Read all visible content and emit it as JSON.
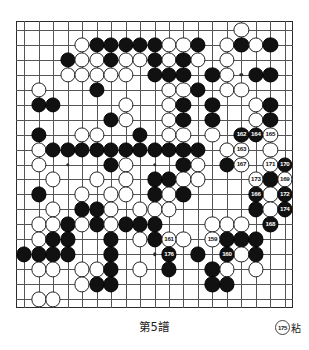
{
  "board": {
    "size": 19,
    "title": "Go game record diagram",
    "colors": {
      "black": "#111111",
      "white": "#ffffff",
      "line": "#555555",
      "border": "#2b2b2b"
    },
    "hoshi": [
      [
        3,
        3
      ],
      [
        9,
        3
      ],
      [
        15,
        3
      ],
      [
        3,
        9
      ],
      [
        9,
        9
      ],
      [
        15,
        9
      ],
      [
        3,
        15
      ],
      [
        9,
        15
      ],
      [
        15,
        15
      ]
    ],
    "stones": [
      {
        "c": "w",
        "x": 15,
        "y": 0
      },
      {
        "c": "w",
        "x": 4,
        "y": 1
      },
      {
        "c": "b",
        "x": 5,
        "y": 1
      },
      {
        "c": "b",
        "x": 6,
        "y": 1
      },
      {
        "c": "b",
        "x": 7,
        "y": 1
      },
      {
        "c": "b",
        "x": 8,
        "y": 1
      },
      {
        "c": "b",
        "x": 9,
        "y": 1
      },
      {
        "c": "w",
        "x": 10,
        "y": 1
      },
      {
        "c": "w",
        "x": 11,
        "y": 1
      },
      {
        "c": "b",
        "x": 12,
        "y": 1
      },
      {
        "c": "w",
        "x": 14,
        "y": 1
      },
      {
        "c": "b",
        "x": 15,
        "y": 1
      },
      {
        "c": "w",
        "x": 16,
        "y": 1
      },
      {
        "c": "b",
        "x": 17,
        "y": 1
      },
      {
        "c": "b",
        "x": 3,
        "y": 2
      },
      {
        "c": "w",
        "x": 4,
        "y": 2
      },
      {
        "c": "w",
        "x": 5,
        "y": 2
      },
      {
        "c": "b",
        "x": 6,
        "y": 2
      },
      {
        "c": "w",
        "x": 7,
        "y": 2
      },
      {
        "c": "w",
        "x": 8,
        "y": 2
      },
      {
        "c": "b",
        "x": 9,
        "y": 2
      },
      {
        "c": "w",
        "x": 10,
        "y": 2
      },
      {
        "c": "b",
        "x": 11,
        "y": 2
      },
      {
        "c": "w",
        "x": 12,
        "y": 2
      },
      {
        "c": "w",
        "x": 14,
        "y": 2
      },
      {
        "c": "w",
        "x": 3,
        "y": 3
      },
      {
        "c": "w",
        "x": 4,
        "y": 3
      },
      {
        "c": "w",
        "x": 5,
        "y": 3
      },
      {
        "c": "w",
        "x": 6,
        "y": 3
      },
      {
        "c": "w",
        "x": 7,
        "y": 3
      },
      {
        "c": "b",
        "x": 9,
        "y": 3
      },
      {
        "c": "b",
        "x": 10,
        "y": 3
      },
      {
        "c": "b",
        "x": 11,
        "y": 3
      },
      {
        "c": "b",
        "x": 13,
        "y": 3
      },
      {
        "c": "w",
        "x": 14,
        "y": 3
      },
      {
        "c": "b",
        "x": 16,
        "y": 3
      },
      {
        "c": "b",
        "x": 17,
        "y": 3
      },
      {
        "c": "w",
        "x": 1,
        "y": 4
      },
      {
        "c": "b",
        "x": 5,
        "y": 4
      },
      {
        "c": "w",
        "x": 10,
        "y": 4
      },
      {
        "c": "w",
        "x": 11,
        "y": 4
      },
      {
        "c": "b",
        "x": 12,
        "y": 4
      },
      {
        "c": "w",
        "x": 14,
        "y": 4
      },
      {
        "c": "w",
        "x": 15,
        "y": 4
      },
      {
        "c": "b",
        "x": 1,
        "y": 5
      },
      {
        "c": "b",
        "x": 2,
        "y": 5
      },
      {
        "c": "w",
        "x": 7,
        "y": 5
      },
      {
        "c": "w",
        "x": 10,
        "y": 5
      },
      {
        "c": "b",
        "x": 11,
        "y": 5
      },
      {
        "c": "b",
        "x": 13,
        "y": 5
      },
      {
        "c": "w",
        "x": 16,
        "y": 5
      },
      {
        "c": "b",
        "x": 17,
        "y": 5
      },
      {
        "c": "b",
        "x": 6,
        "y": 6
      },
      {
        "c": "w",
        "x": 7,
        "y": 6
      },
      {
        "c": "w",
        "x": 10,
        "y": 6
      },
      {
        "c": "b",
        "x": 11,
        "y": 6
      },
      {
        "c": "b",
        "x": 13,
        "y": 6
      },
      {
        "c": "w",
        "x": 16,
        "y": 6
      },
      {
        "c": "b",
        "x": 17,
        "y": 6
      },
      {
        "c": "b",
        "x": 1,
        "y": 7
      },
      {
        "c": "w",
        "x": 4,
        "y": 7
      },
      {
        "c": "w",
        "x": 5,
        "y": 7
      },
      {
        "c": "b",
        "x": 8,
        "y": 7
      },
      {
        "c": "w",
        "x": 10,
        "y": 7
      },
      {
        "c": "w",
        "x": 11,
        "y": 7
      },
      {
        "c": "w",
        "x": 13,
        "y": 7
      },
      {
        "c": "b",
        "x": 15,
        "y": 7,
        "n": "162"
      },
      {
        "c": "b",
        "x": 16,
        "y": 7,
        "n": "164"
      },
      {
        "c": "w",
        "x": 17,
        "y": 7,
        "n": "165"
      },
      {
        "c": "w",
        "x": 1,
        "y": 8
      },
      {
        "c": "b",
        "x": 2,
        "y": 8
      },
      {
        "c": "b",
        "x": 3,
        "y": 8
      },
      {
        "c": "b",
        "x": 4,
        "y": 8
      },
      {
        "c": "b",
        "x": 5,
        "y": 8
      },
      {
        "c": "b",
        "x": 6,
        "y": 8
      },
      {
        "c": "b",
        "x": 7,
        "y": 8
      },
      {
        "c": "b",
        "x": 8,
        "y": 8
      },
      {
        "c": "b",
        "x": 9,
        "y": 8
      },
      {
        "c": "b",
        "x": 10,
        "y": 8
      },
      {
        "c": "b",
        "x": 11,
        "y": 8
      },
      {
        "c": "b",
        "x": 12,
        "y": 8
      },
      {
        "c": "w",
        "x": 14,
        "y": 8
      },
      {
        "c": "w",
        "x": 15,
        "y": 8,
        "n": "163"
      },
      {
        "c": "w",
        "x": 17,
        "y": 8
      },
      {
        "c": "w",
        "x": 1,
        "y": 9
      },
      {
        "c": "b",
        "x": 6,
        "y": 9
      },
      {
        "c": "w",
        "x": 7,
        "y": 9
      },
      {
        "c": "b",
        "x": 11,
        "y": 9
      },
      {
        "c": "w",
        "x": 12,
        "y": 9
      },
      {
        "c": "b",
        "x": 14,
        "y": 9
      },
      {
        "c": "w",
        "x": 15,
        "y": 9,
        "n": "167"
      },
      {
        "c": "w",
        "x": 17,
        "y": 9,
        "n": "171"
      },
      {
        "c": "b",
        "x": 18,
        "y": 9,
        "n": "170"
      },
      {
        "c": "w",
        "x": 2,
        "y": 10
      },
      {
        "c": "w",
        "x": 5,
        "y": 10
      },
      {
        "c": "w",
        "x": 7,
        "y": 10
      },
      {
        "c": "b",
        "x": 9,
        "y": 10
      },
      {
        "c": "b",
        "x": 10,
        "y": 10
      },
      {
        "c": "w",
        "x": 11,
        "y": 10
      },
      {
        "c": "w",
        "x": 12,
        "y": 10
      },
      {
        "c": "w",
        "x": 16,
        "y": 10,
        "n": "173"
      },
      {
        "c": "b",
        "x": 17,
        "y": 10
      },
      {
        "c": "w",
        "x": 18,
        "y": 10,
        "n": "169"
      },
      {
        "c": "b",
        "x": 1,
        "y": 11
      },
      {
        "c": "w",
        "x": 4,
        "y": 11
      },
      {
        "c": "w",
        "x": 6,
        "y": 11
      },
      {
        "c": "w",
        "x": 7,
        "y": 11
      },
      {
        "c": "b",
        "x": 9,
        "y": 11
      },
      {
        "c": "w",
        "x": 10,
        "y": 11
      },
      {
        "c": "b",
        "x": 11,
        "y": 11
      },
      {
        "c": "b",
        "x": 16,
        "y": 11,
        "n": "166"
      },
      {
        "c": "w",
        "x": 17,
        "y": 11
      },
      {
        "c": "b",
        "x": 18,
        "y": 11,
        "n": "172"
      },
      {
        "c": "w",
        "x": 2,
        "y": 12
      },
      {
        "c": "b",
        "x": 4,
        "y": 12
      },
      {
        "c": "b",
        "x": 5,
        "y": 12
      },
      {
        "c": "w",
        "x": 6,
        "y": 12
      },
      {
        "c": "w",
        "x": 8,
        "y": 12
      },
      {
        "c": "w",
        "x": 9,
        "y": 12
      },
      {
        "c": "w",
        "x": 10,
        "y": 12
      },
      {
        "c": "b",
        "x": 16,
        "y": 12
      },
      {
        "c": "w",
        "x": 17,
        "y": 12
      },
      {
        "c": "b",
        "x": 18,
        "y": 12,
        "n": "174"
      },
      {
        "c": "w",
        "x": 1,
        "y": 13
      },
      {
        "c": "w",
        "x": 2,
        "y": 13
      },
      {
        "c": "b",
        "x": 3,
        "y": 13
      },
      {
        "c": "w",
        "x": 4,
        "y": 13
      },
      {
        "c": "b",
        "x": 5,
        "y": 13
      },
      {
        "c": "w",
        "x": 6,
        "y": 13
      },
      {
        "c": "b",
        "x": 7,
        "y": 13
      },
      {
        "c": "b",
        "x": 8,
        "y": 13
      },
      {
        "c": "b",
        "x": 9,
        "y": 13
      },
      {
        "c": "w",
        "x": 13,
        "y": 13
      },
      {
        "c": "w",
        "x": 14,
        "y": 13
      },
      {
        "c": "w",
        "x": 15,
        "y": 13
      },
      {
        "c": "b",
        "x": 17,
        "y": 13,
        "n": "168"
      },
      {
        "c": "w",
        "x": 1,
        "y": 14
      },
      {
        "c": "b",
        "x": 2,
        "y": 14
      },
      {
        "c": "b",
        "x": 3,
        "y": 14
      },
      {
        "c": "b",
        "x": 6,
        "y": 14
      },
      {
        "c": "w",
        "x": 8,
        "y": 14
      },
      {
        "c": "b",
        "x": 9,
        "y": 14
      },
      {
        "c": "w",
        "x": 10,
        "y": 14,
        "n": "161"
      },
      {
        "c": "w",
        "x": 11,
        "y": 14
      },
      {
        "c": "w",
        "x": 13,
        "y": 14,
        "n": "159"
      },
      {
        "c": "b",
        "x": 14,
        "y": 14
      },
      {
        "c": "b",
        "x": 15,
        "y": 14
      },
      {
        "c": "b",
        "x": 16,
        "y": 14
      },
      {
        "c": "b",
        "x": 0,
        "y": 15
      },
      {
        "c": "b",
        "x": 1,
        "y": 15
      },
      {
        "c": "b",
        "x": 2,
        "y": 15
      },
      {
        "c": "b",
        "x": 3,
        "y": 15
      },
      {
        "c": "b",
        "x": 6,
        "y": 15
      },
      {
        "c": "b",
        "x": 10,
        "y": 15,
        "n": "176"
      },
      {
        "c": "b",
        "x": 12,
        "y": 15
      },
      {
        "c": "b",
        "x": 14,
        "y": 15,
        "n": "160"
      },
      {
        "c": "w",
        "x": 15,
        "y": 15
      },
      {
        "c": "b",
        "x": 16,
        "y": 15
      },
      {
        "c": "w",
        "x": 1,
        "y": 16
      },
      {
        "c": "w",
        "x": 2,
        "y": 16
      },
      {
        "c": "w",
        "x": 4,
        "y": 16
      },
      {
        "c": "w",
        "x": 5,
        "y": 16
      },
      {
        "c": "b",
        "x": 6,
        "y": 16
      },
      {
        "c": "w",
        "x": 8,
        "y": 16
      },
      {
        "c": "b",
        "x": 10,
        "y": 16
      },
      {
        "c": "b",
        "x": 13,
        "y": 16
      },
      {
        "c": "w",
        "x": 14,
        "y": 16
      },
      {
        "c": "w",
        "x": 16,
        "y": 16
      },
      {
        "c": "w",
        "x": 4,
        "y": 17
      },
      {
        "c": "b",
        "x": 5,
        "y": 17
      },
      {
        "c": "b",
        "x": 6,
        "y": 17
      },
      {
        "c": "b",
        "x": 13,
        "y": 17
      },
      {
        "c": "b",
        "x": 14,
        "y": 17
      },
      {
        "c": "w",
        "x": 1,
        "y": 18
      },
      {
        "c": "w",
        "x": 2,
        "y": 18
      }
    ]
  },
  "caption": {
    "title": "第5譜",
    "note_number": "175",
    "note_text": "粘"
  }
}
